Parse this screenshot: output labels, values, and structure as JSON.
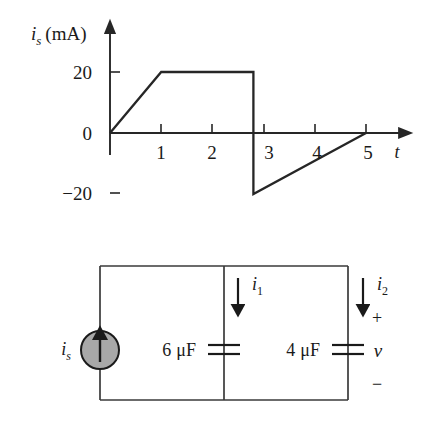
{
  "figure": {
    "background_color": "#ffffff",
    "line_color": "#262626",
    "source_fill_color": "#a8a8a8"
  },
  "chart_data": {
    "type": "line",
    "title": "",
    "xlabel": "t",
    "ylabel": "i_s (mA)",
    "ylabel_variable": "i",
    "ylabel_subscript": "s",
    "ylabel_unit": "(mA)",
    "x": [
      0,
      1,
      2.8,
      2.8,
      5
    ],
    "values": [
      0,
      20,
      20,
      -20,
      0
    ],
    "xlim": [
      0,
      5.6
    ],
    "ylim": [
      -26,
      26
    ],
    "xticks": [
      1,
      2,
      3,
      4,
      5
    ],
    "xtick_labels": [
      "1",
      "2",
      "3",
      "4",
      "5"
    ],
    "yticks": [
      -20,
      0,
      20
    ],
    "ytick_labels": [
      "−20",
      "0",
      "20"
    ],
    "grid": false,
    "legend": false,
    "annotations": [
      "Ramp rises linearly from 0 mA at t=0 to 20 mA at t=1",
      "Constant 20 mA from t=1 to t≈2.8",
      "Vertical drop from +20 mA to −20 mA at t≈2.8",
      "Ramp rises linearly from −20 mA at t≈2.8 to 0 mA at t=5"
    ]
  },
  "circuit": {
    "source": {
      "label_variable": "i",
      "label_subscript": "s",
      "symbol": "current-source-up-arrow"
    },
    "branch_1": {
      "value": "6",
      "unit": "μF",
      "current_variable": "i",
      "current_subscript": "1",
      "current_direction": "down"
    },
    "branch_2": {
      "value": "4",
      "unit": "μF",
      "current_variable": "i",
      "current_subscript": "2",
      "current_direction": "down",
      "voltage_variable": "v",
      "polarity_plus": "+",
      "polarity_minus": "−"
    }
  }
}
